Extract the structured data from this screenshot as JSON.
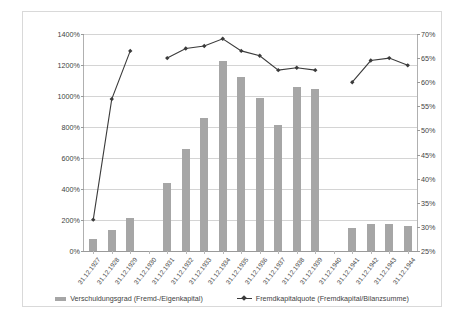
{
  "chart_data": {
    "type": "bar",
    "title": "",
    "xlabel": "",
    "ylabel": "",
    "grid": true,
    "legend_position": "bottom",
    "categories": [
      "31.12.1927",
      "31.12.1928",
      "31.12.1929",
      "31.12.1930",
      "31.12.1931",
      "31.12.1932",
      "31.12.1933",
      "31.12.1934",
      "31.12.1935",
      "31.12.1936",
      "31.12.1937",
      "31.12.1938",
      "31.12.1939",
      "31.12.1940",
      "31.12.1941",
      "31.12.1942",
      "31.12.1943",
      "31.12.1944"
    ],
    "series": [
      {
        "name": "Verschuldungsgrad (Fremd-/Eigenkapital)",
        "type": "bar",
        "axis": "left",
        "color": "#a6a6a6",
        "values": [
          75,
          135,
          210,
          null,
          440,
          655,
          855,
          1225,
          1120,
          985,
          810,
          1055,
          1045,
          null,
          150,
          175,
          175,
          160
        ]
      },
      {
        "name": "Fremdkapitalquote (Fremdkapital/Bilanzsumme)",
        "type": "line",
        "axis": "right",
        "color": "#3b3b3b",
        "values": [
          31.5,
          56.5,
          66.5,
          null,
          65.0,
          67.0,
          67.5,
          69.0,
          66.5,
          65.5,
          62.5,
          63.0,
          62.5,
          null,
          60.0,
          64.5,
          65.0,
          63.5
        ]
      }
    ],
    "y_axis_left": {
      "min": 0,
      "max": 1400,
      "step": 200,
      "ticks": [
        "0%",
        "200%",
        "400%",
        "600%",
        "800%",
        "1000%",
        "1200%",
        "1400%"
      ]
    },
    "y_axis_right": {
      "min": 25,
      "max": 70,
      "step": 5,
      "ticks": [
        "25%",
        "30%",
        "35%",
        "40%",
        "45%",
        "50%",
        "55%",
        "60%",
        "65%",
        "70%"
      ]
    }
  },
  "legend": {
    "bar_label": "Verschuldungsgrad (Fremd-/Eigenkapital)",
    "line_label": "Fremdkapitalquote (Fremdkapital/Bilanzsumme)"
  },
  "caption": {
    "text": ""
  }
}
